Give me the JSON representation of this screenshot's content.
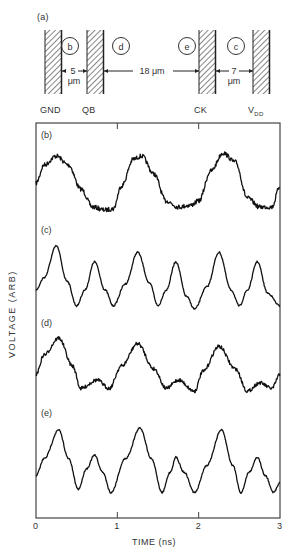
{
  "diagram": {
    "label": "(a)",
    "electrodes": [
      {
        "name": "GND",
        "x": 45
      },
      {
        "name": "QB",
        "x": 87
      },
      {
        "name": "CK",
        "x": 199
      },
      {
        "name": "V",
        "sub": "DD",
        "x": 253
      }
    ],
    "probes": [
      {
        "label": "b",
        "cx": 70
      },
      {
        "label": "d",
        "cx": 121
      },
      {
        "label": "e",
        "cx": 187
      },
      {
        "label": "c",
        "cx": 236
      }
    ],
    "gaps": [
      {
        "value": "5",
        "unit": "μm"
      },
      {
        "value": "18 μm"
      },
      {
        "value": "7",
        "unit": "μm"
      }
    ]
  },
  "chart_data": {
    "type": "line",
    "title": "",
    "xlabel": "TIME (ns)",
    "ylabel": "VOLTAGE (ARB)",
    "xlim": [
      0,
      3
    ],
    "x_ticks": [
      "0",
      "1",
      "2",
      "3"
    ],
    "grid": false,
    "panels": [
      {
        "name": "(b)",
        "probe": "b",
        "x": [
          0,
          0.1,
          0.25,
          0.4,
          0.55,
          0.7,
          0.85,
          0.95,
          1.05,
          1.2,
          1.3,
          1.45,
          1.6,
          1.75,
          1.9,
          2.0,
          2.15,
          2.3,
          2.45,
          2.6,
          2.75,
          2.9,
          3.0
        ],
        "values": [
          0.45,
          0.75,
          0.9,
          0.75,
          0.35,
          0.05,
          0.0,
          0.02,
          0.4,
          0.85,
          0.9,
          0.6,
          0.15,
          0.05,
          0.08,
          0.15,
          0.65,
          0.95,
          0.8,
          0.2,
          0.05,
          0.05,
          0.4
        ]
      },
      {
        "name": "(c)",
        "probe": "c",
        "x": [
          0,
          0.1,
          0.25,
          0.38,
          0.5,
          0.6,
          0.72,
          0.85,
          0.95,
          1.1,
          1.25,
          1.4,
          1.5,
          1.6,
          1.72,
          1.85,
          1.95,
          2.1,
          2.25,
          2.4,
          2.5,
          2.6,
          2.72,
          2.85,
          3.0
        ],
        "values": [
          0.3,
          0.5,
          1.0,
          0.45,
          0.05,
          0.3,
          0.75,
          0.3,
          0.05,
          0.4,
          0.9,
          0.4,
          0.05,
          0.3,
          0.75,
          0.2,
          0.0,
          0.35,
          0.9,
          0.3,
          0.05,
          0.3,
          0.75,
          0.25,
          0.05
        ]
      },
      {
        "name": "(d)",
        "probe": "d",
        "x": [
          0,
          0.1,
          0.28,
          0.45,
          0.55,
          0.75,
          0.9,
          1.05,
          1.25,
          1.45,
          1.6,
          1.75,
          1.95,
          2.05,
          2.25,
          2.45,
          2.6,
          2.75,
          2.9,
          3.0
        ],
        "values": [
          0.35,
          0.7,
          1.0,
          0.5,
          0.1,
          0.25,
          0.1,
          0.5,
          0.9,
          0.45,
          0.1,
          0.25,
          0.05,
          0.4,
          0.85,
          0.45,
          0.05,
          0.2,
          0.1,
          0.35
        ]
      },
      {
        "name": "(e)",
        "probe": "e",
        "x": [
          0,
          0.1,
          0.28,
          0.4,
          0.52,
          0.62,
          0.72,
          0.82,
          0.92,
          1.1,
          1.28,
          1.42,
          1.55,
          1.65,
          1.72,
          1.82,
          1.95,
          2.1,
          2.28,
          2.42,
          2.52,
          2.62,
          2.72,
          2.82,
          2.92,
          3.0
        ],
        "values": [
          0.3,
          0.55,
          0.97,
          0.55,
          0.1,
          0.4,
          0.6,
          0.35,
          0.05,
          0.55,
          1.0,
          0.55,
          0.05,
          0.35,
          0.57,
          0.35,
          0.05,
          0.45,
          0.97,
          0.45,
          0.05,
          0.35,
          0.57,
          0.3,
          0.05,
          0.2
        ]
      }
    ]
  },
  "layout": {
    "plot": {
      "left": 36,
      "top": 123,
      "right": 280,
      "bottom": 518
    },
    "panel_bands": [
      [
        150,
        210
      ],
      [
        246,
        309
      ],
      [
        338,
        394
      ],
      [
        428,
        496
      ]
    ],
    "panel_label_y": [
      130,
      225,
      318,
      408
    ]
  }
}
